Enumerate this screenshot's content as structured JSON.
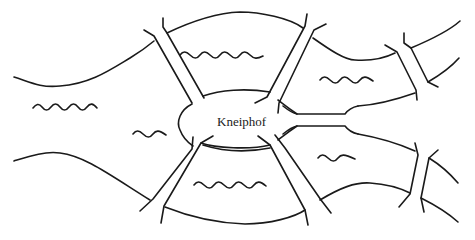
{
  "diagram": {
    "island_label": "Kneiphof",
    "ink_color": "#1a1a1a",
    "background_color": "#ffffff",
    "regions": [
      "north-bank",
      "south-bank",
      "kneiphof-island",
      "east-island"
    ],
    "bridge_count": 7
  }
}
